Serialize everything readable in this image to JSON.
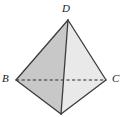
{
  "figure": {
    "name": "tetrahedron",
    "background_color": "#ffffff",
    "stroke_color": "#3c3c3c",
    "hidden_edge_color": "#2b2b2b",
    "label_color": "#1a1a1a",
    "vertices": {
      "D": {
        "label": "D",
        "x": 68,
        "y": 20
      },
      "B": {
        "label": "B",
        "x": 16,
        "y": 80
      },
      "C": {
        "label": "C",
        "x": 106,
        "y": 80
      },
      "A": {
        "label": "",
        "x": 61,
        "y": 114
      }
    },
    "faces": [
      {
        "name": "face-bda-upper",
        "points": "16,80 68,20 61,114",
        "fill": "#c9c9c9"
      },
      {
        "name": "face-dac-right",
        "points": "68,20 106,80 61,114",
        "fill": "#e8e8e8"
      },
      {
        "name": "face-bac-bottom",
        "points": "16,80 61,114 106,80",
        "fill": "#d6d6d6"
      }
    ],
    "edges": [
      {
        "name": "edge-BD",
        "x1": 16,
        "y1": 80,
        "x2": 68,
        "y2": 20,
        "style": "solid"
      },
      {
        "name": "edge-DC",
        "x1": 68,
        "y1": 20,
        "x2": 106,
        "y2": 80,
        "style": "solid"
      },
      {
        "name": "edge-DA",
        "x1": 68,
        "y1": 20,
        "x2": 61,
        "y2": 114,
        "style": "solid"
      },
      {
        "name": "edge-BA",
        "x1": 16,
        "y1": 80,
        "x2": 61,
        "y2": 114,
        "style": "solid"
      },
      {
        "name": "edge-AC",
        "x1": 61,
        "y1": 114,
        "x2": 106,
        "y2": 80,
        "style": "solid"
      },
      {
        "name": "edge-BC",
        "x1": 16,
        "y1": 80,
        "x2": 106,
        "y2": 80,
        "style": "dashed"
      }
    ],
    "labels": {
      "D": "D",
      "B": "B",
      "C": "C"
    }
  }
}
